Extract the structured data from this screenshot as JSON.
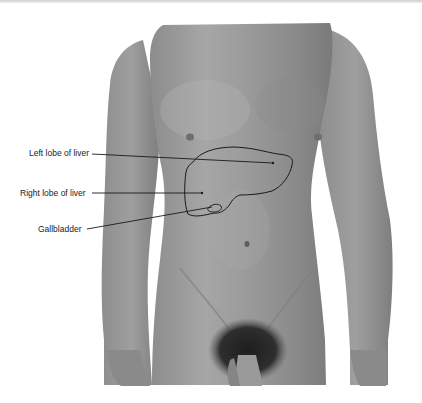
{
  "figure": {
    "labels": [
      {
        "id": "left-lobe",
        "text": "Left lobe of liver"
      },
      {
        "id": "right-lobe",
        "text": "Right lobe of liver"
      },
      {
        "id": "gallbladder",
        "text": "Gallbladder"
      }
    ]
  },
  "colors": {
    "background": "#ffffff",
    "skin_light": "#a9a9a9",
    "skin_mid": "#8e8e8e",
    "skin_dark": "#6f6f6f",
    "outline": "#1a1a1a"
  }
}
